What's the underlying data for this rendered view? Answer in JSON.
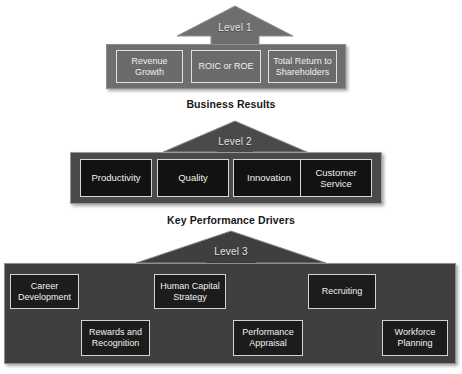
{
  "diagram": {
    "colors": {
      "level1_bar": "#6e6e6e",
      "level1_box": "#6b6b6b",
      "level2_bar": "#4a4a4a",
      "level2_box": "#121212",
      "level3_bar": "#3f3f3f",
      "level3_box": "#1c1c1c",
      "arrow_level1": "#6e6e6e",
      "arrow_level2": "#4a4a4a",
      "arrow_level3": "#3f3f3f",
      "box_border": "#e3e1dd",
      "box_text": "#f2f0ec",
      "caption_text": "#17181a",
      "page_background": "#ffffff"
    },
    "levels": [
      {
        "id": "level1",
        "arrow_label": "Level 1",
        "caption": "Business Results",
        "boxes": [
          {
            "label": "Revenue\nGrowth"
          },
          {
            "label": "ROIC or ROE"
          },
          {
            "label": "Total Return to\nShareholders"
          }
        ]
      },
      {
        "id": "level2",
        "arrow_label": "Level 2",
        "caption": "Key Performance Drivers",
        "boxes": [
          {
            "label": "Productivity"
          },
          {
            "label": "Quality"
          },
          {
            "label": "Innovation"
          },
          {
            "label": "Customer\nService"
          }
        ]
      },
      {
        "id": "level3",
        "arrow_label": "Level 3",
        "caption": "",
        "boxes": [
          {
            "label": "Career\nDevelopment"
          },
          {
            "label": "Rewards and\nRecognition"
          },
          {
            "label": "Human Capital\nStrategy"
          },
          {
            "label": "Performance\nAppraisal"
          },
          {
            "label": "Recruiting"
          },
          {
            "label": "Workforce\nPlanning"
          }
        ]
      }
    ]
  }
}
